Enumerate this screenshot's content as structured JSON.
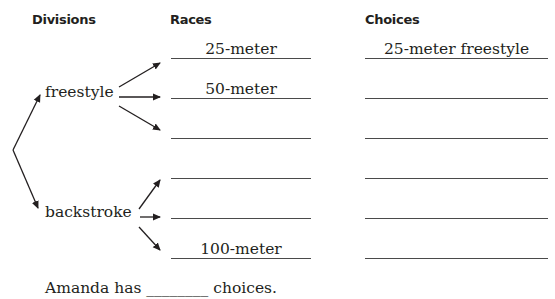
{
  "headers": {
    "divisions": "Divisions",
    "races": "Races",
    "choices": "Choices"
  },
  "divisions": [
    {
      "label": "freestyle"
    },
    {
      "label": "backstroke"
    }
  ],
  "races": [
    {
      "label": "25-meter"
    },
    {
      "label": "50-meter"
    },
    {
      "label": ""
    },
    {
      "label": ""
    },
    {
      "label": ""
    },
    {
      "label": "100-meter"
    }
  ],
  "choices": [
    {
      "label": "25-meter freestyle"
    },
    {
      "label": ""
    },
    {
      "label": ""
    },
    {
      "label": ""
    },
    {
      "label": ""
    },
    {
      "label": ""
    }
  ],
  "sentence": {
    "prefix": "Amanda has",
    "blank": "________",
    "suffix": "choices."
  }
}
